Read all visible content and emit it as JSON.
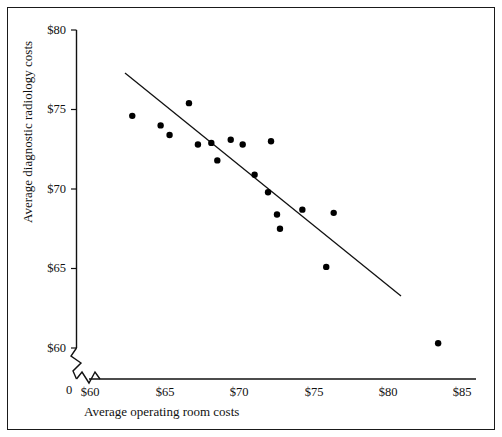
{
  "chart_data": {
    "type": "scatter",
    "title": "",
    "xlabel": "Average operating room costs",
    "ylabel": "Average diagnostic radiology costs",
    "xlim": [
      58.5,
      85.5
    ],
    "ylim": [
      59.0,
      80.0
    ],
    "xticks": [
      60,
      65,
      70,
      75,
      80,
      85
    ],
    "xtick_labels": [
      "$60",
      "$65",
      "$70",
      "$75",
      "$80",
      "$85"
    ],
    "yticks": [
      60,
      65,
      70,
      75,
      80
    ],
    "ytick_labels": [
      "$60",
      "$65",
      "$70",
      "$75",
      "$80"
    ],
    "origin_label": "0",
    "grid": false,
    "legend": null,
    "axis_break_x": true,
    "axis_break_y": true,
    "marker": "filled-circle",
    "marker_color": "#000000",
    "points": [
      {
        "x": 62.9,
        "y": 74.6
      },
      {
        "x": 64.8,
        "y": 74.0
      },
      {
        "x": 65.4,
        "y": 73.4
      },
      {
        "x": 66.7,
        "y": 75.4
      },
      {
        "x": 67.3,
        "y": 72.8
      },
      {
        "x": 68.2,
        "y": 72.9
      },
      {
        "x": 68.6,
        "y": 71.8
      },
      {
        "x": 69.5,
        "y": 73.1
      },
      {
        "x": 70.3,
        "y": 72.8
      },
      {
        "x": 71.1,
        "y": 70.9
      },
      {
        "x": 72.2,
        "y": 73.0
      },
      {
        "x": 72.0,
        "y": 69.8
      },
      {
        "x": 72.6,
        "y": 68.4
      },
      {
        "x": 72.8,
        "y": 67.5
      },
      {
        "x": 74.3,
        "y": 68.7
      },
      {
        "x": 76.4,
        "y": 68.5
      },
      {
        "x": 75.9,
        "y": 65.1
      },
      {
        "x": 83.4,
        "y": 60.3
      }
    ],
    "fit_line": {
      "type": "linear-regression",
      "x_start": 61.9,
      "y_start": 77.3,
      "x_end": 78.4,
      "y_end": 63.9
    }
  }
}
